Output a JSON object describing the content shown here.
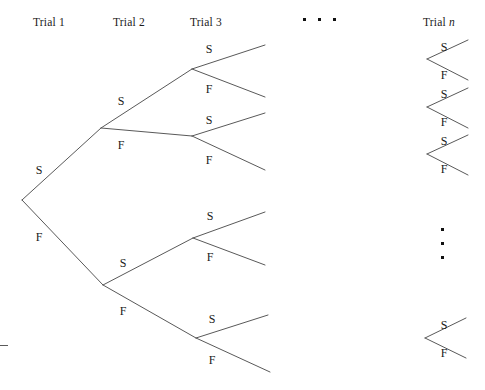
{
  "figure": {
    "line_color": "#595959",
    "text_color": "#1b1b1b",
    "background": "#ffffff",
    "width": 485,
    "height": 390
  },
  "columns": [
    {
      "id": "trial-1",
      "label": "Trial 1",
      "x": 33,
      "y": 16
    },
    {
      "id": "trial-2",
      "label": "Trial 2",
      "x": 113,
      "y": 16
    },
    {
      "id": "trial-3",
      "label": "Trial 3",
      "x": 190,
      "y": 16
    },
    {
      "id": "trial-n",
      "label": "Trial ",
      "italic": "n",
      "x": 423,
      "y": 16
    }
  ],
  "outcomes": {
    "success": "S",
    "failure": "F"
  },
  "branch_labels": [
    {
      "id": "t1-s",
      "text": "S",
      "x": 39,
      "y": 170
    },
    {
      "id": "t1-f",
      "text": "F",
      "x": 39,
      "y": 237
    },
    {
      "id": "t2-ss",
      "text": "S",
      "x": 121,
      "y": 101
    },
    {
      "id": "t2-sf",
      "text": "F",
      "x": 121,
      "y": 145
    },
    {
      "id": "t2-fs",
      "text": "S",
      "x": 123,
      "y": 263
    },
    {
      "id": "t2-ff",
      "text": "F",
      "x": 123,
      "y": 311
    },
    {
      "id": "t3-sss",
      "text": "S",
      "x": 209,
      "y": 49
    },
    {
      "id": "t3-ssf",
      "text": "F",
      "x": 209,
      "y": 89
    },
    {
      "id": "t3-sfs",
      "text": "S",
      "x": 209,
      "y": 120
    },
    {
      "id": "t3-sff",
      "text": "F",
      "x": 209,
      "y": 160
    },
    {
      "id": "t3-fss",
      "text": "S",
      "x": 210,
      "y": 216
    },
    {
      "id": "t3-fsf",
      "text": "F",
      "x": 210,
      "y": 257
    },
    {
      "id": "t3-ffs",
      "text": "S",
      "x": 212,
      "y": 319
    },
    {
      "id": "t3-fff",
      "text": "F",
      "x": 212,
      "y": 360
    },
    {
      "id": "tn-1-s",
      "text": "S",
      "x": 444,
      "y": 47
    },
    {
      "id": "tn-1-f",
      "text": "F",
      "x": 444,
      "y": 75
    },
    {
      "id": "tn-2-s",
      "text": "S",
      "x": 444,
      "y": 94
    },
    {
      "id": "tn-2-f",
      "text": "F",
      "x": 444,
      "y": 122
    },
    {
      "id": "tn-3-s",
      "text": "S",
      "x": 444,
      "y": 141
    },
    {
      "id": "tn-3-f",
      "text": "F",
      "x": 444,
      "y": 169
    },
    {
      "id": "tn-last-s",
      "text": "S",
      "x": 444,
      "y": 325
    },
    {
      "id": "tn-last-f",
      "text": "F",
      "x": 444,
      "y": 353
    }
  ],
  "edges": [
    {
      "id": "root-to-s",
      "x1": 22,
      "y1": 200,
      "x2": 101,
      "y2": 128
    },
    {
      "id": "root-to-f",
      "x1": 22,
      "y1": 200,
      "x2": 103,
      "y2": 285
    },
    {
      "id": "s-to-ss",
      "x1": 101,
      "y1": 128,
      "x2": 192,
      "y2": 69
    },
    {
      "id": "s-to-sf",
      "x1": 101,
      "y1": 128,
      "x2": 192,
      "y2": 136
    },
    {
      "id": "f-to-fs",
      "x1": 103,
      "y1": 285,
      "x2": 193,
      "y2": 238
    },
    {
      "id": "f-to-ff",
      "x1": 103,
      "y1": 285,
      "x2": 196,
      "y2": 338
    },
    {
      "id": "ss-to-sss",
      "x1": 192,
      "y1": 69,
      "x2": 265,
      "y2": 45
    },
    {
      "id": "ss-to-ssf",
      "x1": 192,
      "y1": 69,
      "x2": 265,
      "y2": 97
    },
    {
      "id": "sf-to-sfs",
      "x1": 192,
      "y1": 136,
      "x2": 265,
      "y2": 113
    },
    {
      "id": "sf-to-sff",
      "x1": 192,
      "y1": 136,
      "x2": 265,
      "y2": 170
    },
    {
      "id": "fs-to-fss",
      "x1": 193,
      "y1": 238,
      "x2": 265,
      "y2": 212
    },
    {
      "id": "fs-to-fsf",
      "x1": 193,
      "y1": 238,
      "x2": 265,
      "y2": 265
    },
    {
      "id": "ff-to-ffs",
      "x1": 196,
      "y1": 338,
      "x2": 268,
      "y2": 315
    },
    {
      "id": "ff-to-fff",
      "x1": 196,
      "y1": 338,
      "x2": 270,
      "y2": 372
    },
    {
      "id": "tn1-s",
      "x1": 427,
      "y1": 59,
      "x2": 468,
      "y2": 40
    },
    {
      "id": "tn1-f",
      "x1": 427,
      "y1": 59,
      "x2": 468,
      "y2": 80
    },
    {
      "id": "tn2-s",
      "x1": 427,
      "y1": 107,
      "x2": 468,
      "y2": 88
    },
    {
      "id": "tn2-f",
      "x1": 427,
      "y1": 107,
      "x2": 468,
      "y2": 128
    },
    {
      "id": "tn3-s",
      "x1": 427,
      "y1": 154,
      "x2": 468,
      "y2": 135
    },
    {
      "id": "tn3-f",
      "x1": 427,
      "y1": 154,
      "x2": 468,
      "y2": 175
    },
    {
      "id": "tnlast-s",
      "x1": 425,
      "y1": 338,
      "x2": 466,
      "y2": 318
    },
    {
      "id": "tnlast-f",
      "x1": 425,
      "y1": 338,
      "x2": 466,
      "y2": 358
    }
  ],
  "ellipses": [
    {
      "id": "ellipsis-horizontal",
      "orientation": "horizontal",
      "x": 303,
      "y": 18,
      "count": 3
    },
    {
      "id": "ellipsis-vertical",
      "orientation": "vertical",
      "x": 441,
      "y": 228,
      "count": 3
    }
  ],
  "edge_marks": [
    {
      "id": "left-edge-tick",
      "x": 0,
      "y": 345,
      "width": 8
    }
  ]
}
